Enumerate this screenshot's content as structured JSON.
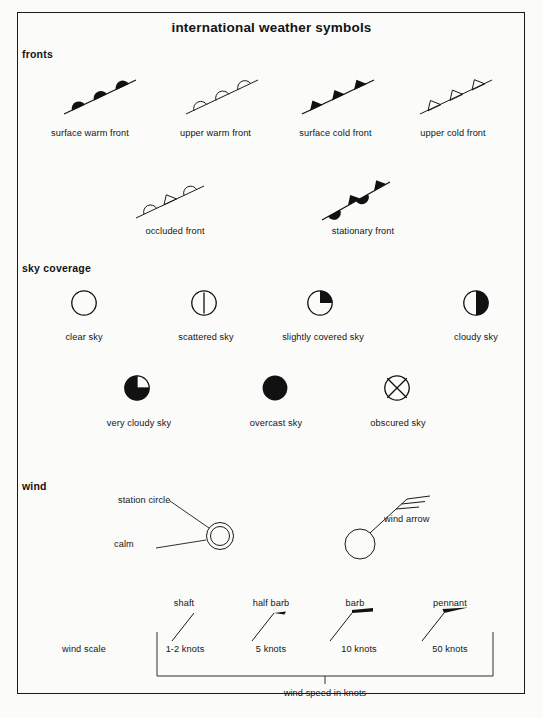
{
  "page": {
    "title": "international weather symbols",
    "background_color": "#fbfbf9",
    "ink_color": "#111111",
    "border_color": "#1b1b1b"
  },
  "sections": {
    "fronts": {
      "heading": "fronts",
      "items_row1": [
        {
          "label": "surface warm front",
          "symbol": "surface-warm-front",
          "style": "filled semicircles on line"
        },
        {
          "label": "upper warm front",
          "symbol": "upper-warm-front",
          "style": "open semicircles on line"
        },
        {
          "label": "surface cold front",
          "symbol": "surface-cold-front",
          "style": "filled triangles on line"
        },
        {
          "label": "upper cold front",
          "symbol": "upper-cold-front",
          "style": "open triangles on line"
        }
      ],
      "items_row2": [
        {
          "label": "occluded front",
          "symbol": "occluded-front",
          "style": "alternating open semicircles and triangles"
        },
        {
          "label": "stationary front",
          "symbol": "stationary-front",
          "style": "filled triangles above and semicircles below"
        }
      ]
    },
    "sky_coverage": {
      "heading": "sky coverage",
      "items_row1": [
        {
          "label": "clear sky",
          "symbol": "clear-sky",
          "coverage": "0"
        },
        {
          "label": "scattered sky",
          "symbol": "scattered-sky",
          "coverage": "line"
        },
        {
          "label": "slightly covered sky",
          "symbol": "slightly-covered-sky",
          "coverage": "quarter"
        },
        {
          "label": "cloudy sky",
          "symbol": "cloudy-sky",
          "coverage": "half"
        }
      ],
      "items_row2": [
        {
          "label": "very cloudy sky",
          "symbol": "very-cloudy-sky",
          "coverage": "three-quarter"
        },
        {
          "label": "overcast sky",
          "symbol": "overcast-sky",
          "coverage": "full"
        },
        {
          "label": "obscured sky",
          "symbol": "obscured-sky",
          "coverage": "crossed"
        }
      ]
    },
    "wind": {
      "heading": "wind",
      "calm_labels": {
        "station_circle": "station circle",
        "calm": "calm"
      },
      "wind_arrow_label": "wind arrow",
      "scale_label": "wind scale",
      "scale_axis_label": "wind speed in knots",
      "scale_items": [
        {
          "name": "shaft",
          "value": "1-2 knots"
        },
        {
          "name": "half barb",
          "value": "5 knots"
        },
        {
          "name": "barb",
          "value": "10 knots"
        },
        {
          "name": "pennant",
          "value": "50 knots"
        }
      ]
    }
  }
}
